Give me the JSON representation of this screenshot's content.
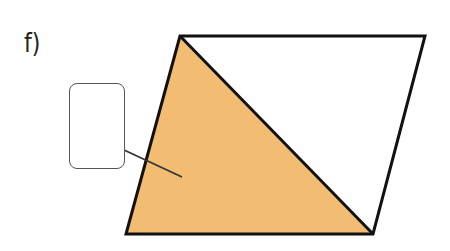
{
  "question": {
    "label": "f)"
  },
  "figure": {
    "shape": "parallelogram",
    "vertices": {
      "top_left": [
        180,
        36
      ],
      "top_right": [
        425,
        36
      ],
      "bottom_right": [
        373,
        234
      ],
      "bottom_left": [
        126,
        234
      ]
    },
    "diagonal": "top_left to bottom_right",
    "shaded_region": "triangle top_left, bottom_right, bottom_left",
    "colors": {
      "shade": "#f2bd72",
      "stroke": "#111111",
      "background": "#ffffff"
    }
  },
  "answer_box": {
    "value": "",
    "placeholder": ""
  }
}
